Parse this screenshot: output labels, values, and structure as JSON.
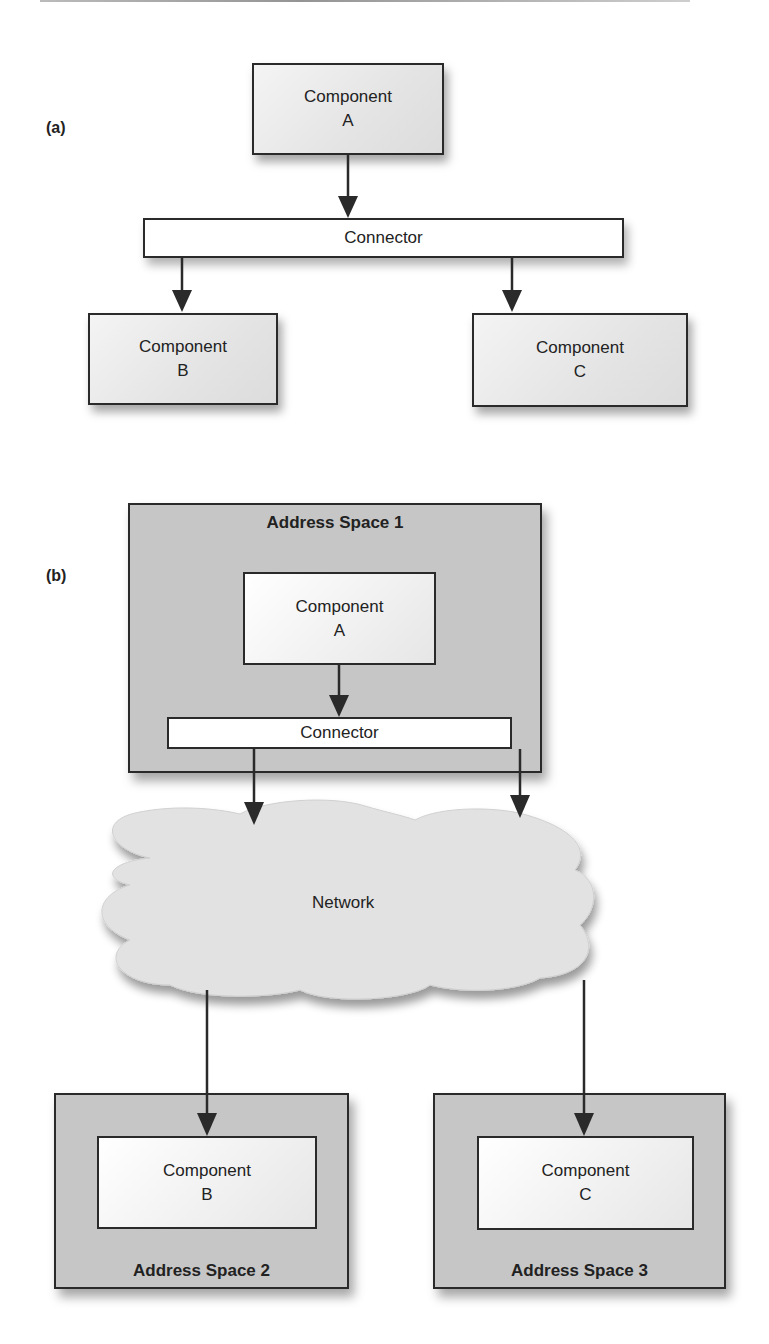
{
  "panels": {
    "a": {
      "label": "(a)",
      "component_a": {
        "name": "Component",
        "id": "A"
      },
      "connector": "Connector",
      "component_b": {
        "name": "Component",
        "id": "B"
      },
      "component_c": {
        "name": "Component",
        "id": "C"
      }
    },
    "b": {
      "label": "(b)",
      "address_space_1": {
        "title": "Address Space 1",
        "component_a": {
          "name": "Component",
          "id": "A"
        },
        "connector": "Connector"
      },
      "network": "Network",
      "address_space_2": {
        "title": "Address Space 2",
        "component_b": {
          "name": "Component",
          "id": "B"
        }
      },
      "address_space_3": {
        "title": "Address Space 3",
        "component_c": {
          "name": "Component",
          "id": "C"
        }
      }
    }
  },
  "colors": {
    "stroke": "#2a2a2a",
    "address_space_fill": "#c6c6c6",
    "cloud_fill": "#e2e2e2",
    "connector_fill": "#ffffff"
  }
}
